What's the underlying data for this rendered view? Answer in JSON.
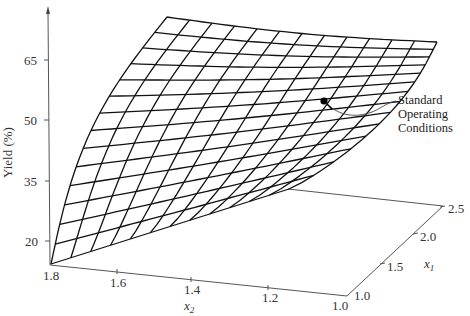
{
  "chart_data": {
    "type": "surface",
    "title": "",
    "zlabel": "Yield (%)",
    "xlabel": "x2",
    "ylabel": "x1",
    "z_ticks": [
      "20",
      "35",
      "50",
      "65"
    ],
    "x2_ticks": [
      "1.8",
      "1.6",
      "1.4",
      "1.2",
      "1.0"
    ],
    "x1_ticks": [
      "1.0",
      "1.5",
      "2.0",
      "2.5"
    ],
    "x2_range": [
      1.0,
      1.8
    ],
    "x1_range": [
      1.0,
      2.5
    ],
    "z_range": [
      15,
      75
    ],
    "grid_lines": {
      "x1_divisions": 14,
      "x2_divisions": 12
    },
    "surface_corners": [
      {
        "x2": 1.8,
        "x1": 1.0,
        "yield": 17
      },
      {
        "x2": 1.8,
        "x1": 2.5,
        "yield": 70
      },
      {
        "x2": 1.0,
        "x1": 2.5,
        "yield": 69
      },
      {
        "x2": 1.0,
        "x1": 1.0,
        "yield": 40
      }
    ],
    "annotation": {
      "label_lines": [
        "Standard",
        "Operating",
        "Conditions"
      ],
      "point": {
        "x2": 1.35,
        "x1": 2.0,
        "yield": 54
      }
    },
    "colors": {
      "mesh": "#111111",
      "axis": "#555555",
      "background": "#ffffff"
    }
  },
  "labels": {
    "z_axis_title": "Yield (%)",
    "x2_axis_var": "x",
    "x2_axis_sub": "2",
    "x1_axis_var": "x",
    "x1_axis_sub": "1",
    "annot_line1": "Standard",
    "annot_line2": "Operating",
    "annot_line3": "Conditions",
    "z_tick_65": "65",
    "z_tick_50": "50",
    "z_tick_35": "35",
    "z_tick_20": "20",
    "x2_tick_18": "1.8",
    "x2_tick_16": "1.6",
    "x2_tick_14": "1.4",
    "x2_tick_12": "1.2",
    "x2_tick_10": "1.0",
    "x1_tick_10": "1.0",
    "x1_tick_15": "1.5",
    "x1_tick_20": "2.0",
    "x1_tick_25": "2.5"
  }
}
